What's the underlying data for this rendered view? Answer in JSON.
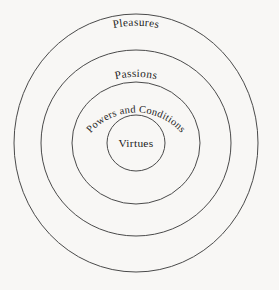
{
  "diagram": {
    "type": "concentric-rings",
    "background_color": "#f8f7f5",
    "stroke_color": "#4a4a4a",
    "text_color": "#1c1c1c",
    "center_x": 136,
    "center_y": 143,
    "rings": [
      {
        "index": 1,
        "label": "Pleasures",
        "position": "outermost",
        "rx": 122,
        "ry": 129,
        "label_curved": true
      },
      {
        "index": 2,
        "label": "Passions",
        "position": "second",
        "rx": 95,
        "ry": 93,
        "label_curved": true
      },
      {
        "index": 3,
        "label": "Powers and Conditions",
        "position": "third",
        "rx": 64,
        "ry": 61,
        "label_curved": true
      },
      {
        "index": 4,
        "label": "Virtues",
        "position": "innermost",
        "rx": 29,
        "ry": 28,
        "label_curved": false
      }
    ]
  }
}
